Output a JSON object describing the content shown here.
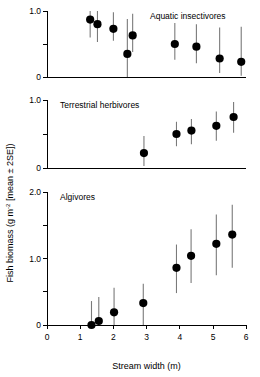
{
  "figure": {
    "ylabel_main": "Fish biomass (g m",
    "ylabel_sup": "-2",
    "ylabel_tail": " [mean ± 2SE])",
    "xlabel": "Stream width (m)",
    "marker_color": "#000000",
    "errorbar_color": "#7a7a7a",
    "axis_color": "#000000"
  },
  "chart_data": [
    {
      "type": "scatter",
      "title": "Aquatic insectivores",
      "panel": 1,
      "xlabel": "Stream width (m)",
      "ylabel": "Fish biomass (g m-2 [mean ± 2SE])",
      "xlim": [
        0,
        6
      ],
      "ylim": [
        0,
        1.0
      ],
      "xticks": [
        0,
        1,
        2,
        3,
        4,
        5,
        6
      ],
      "yticks": [
        0,
        0.5,
        1.0
      ],
      "ytick_labels": [
        "0",
        "",
        "1.0"
      ],
      "grid": false,
      "legend": "none",
      "errorbars": "mean ± 2SE",
      "points": [
        {
          "x": 1.3,
          "y": 0.87,
          "lo": 0.6,
          "hi": 1.0
        },
        {
          "x": 1.52,
          "y": 0.8,
          "lo": 0.53,
          "hi": 1.0
        },
        {
          "x": 2.0,
          "y": 0.73,
          "lo": 0.55,
          "hi": 0.98
        },
        {
          "x": 2.42,
          "y": 0.35,
          "lo": 0.0,
          "hi": 0.88
        },
        {
          "x": 2.58,
          "y": 0.63,
          "lo": 0.38,
          "hi": 0.96
        },
        {
          "x": 3.85,
          "y": 0.5,
          "lo": 0.26,
          "hi": 0.82
        },
        {
          "x": 4.5,
          "y": 0.46,
          "lo": 0.21,
          "hi": 0.8
        },
        {
          "x": 5.2,
          "y": 0.28,
          "lo": 0.06,
          "hi": 0.75
        },
        {
          "x": 5.85,
          "y": 0.23,
          "lo": 0.02,
          "hi": 0.76
        }
      ]
    },
    {
      "type": "scatter",
      "title": "Terrestrial herbivores",
      "panel": 2,
      "xlabel": "Stream width (m)",
      "ylabel": "Fish biomass (g m-2 [mean ± 2SE])",
      "xlim": [
        0,
        6
      ],
      "ylim": [
        0,
        1.0
      ],
      "xticks": [
        0,
        1,
        2,
        3,
        4,
        5,
        6
      ],
      "yticks": [
        0,
        0.5,
        1.0
      ],
      "ytick_labels": [
        "0",
        "",
        "1.0"
      ],
      "grid": false,
      "legend": "none",
      "errorbars": "mean ± 2SE",
      "points": [
        {
          "x": 2.92,
          "y": 0.22,
          "lo": 0.03,
          "hi": 0.47
        },
        {
          "x": 3.9,
          "y": 0.5,
          "lo": 0.32,
          "hi": 0.68
        },
        {
          "x": 4.35,
          "y": 0.55,
          "lo": 0.35,
          "hi": 0.72
        },
        {
          "x": 5.1,
          "y": 0.62,
          "lo": 0.4,
          "hi": 0.83
        },
        {
          "x": 5.62,
          "y": 0.75,
          "lo": 0.52,
          "hi": 0.97
        }
      ]
    },
    {
      "type": "scatter",
      "title": "Algivores",
      "panel": 3,
      "xlabel": "Stream width (m)",
      "ylabel": "Fish biomass (g m-2 [mean ± 2SE])",
      "xlim": [
        0,
        6
      ],
      "ylim": [
        0,
        2.0
      ],
      "xticks": [
        0,
        1,
        2,
        3,
        4,
        5,
        6
      ],
      "yticks": [
        0,
        0.5,
        1.0,
        1.5,
        2.0
      ],
      "ytick_labels": [
        "0",
        "",
        "1.0",
        "",
        "2.0"
      ],
      "grid": false,
      "legend": "none",
      "errorbars": "mean ± 2SE",
      "points": [
        {
          "x": 1.34,
          "y": 0.0,
          "lo": 0.0,
          "hi": 0.36
        },
        {
          "x": 1.56,
          "y": 0.06,
          "lo": 0.0,
          "hi": 0.42
        },
        {
          "x": 2.02,
          "y": 0.19,
          "lo": 0.0,
          "hi": 0.56
        },
        {
          "x": 2.9,
          "y": 0.33,
          "lo": 0.0,
          "hi": 0.62
        },
        {
          "x": 3.9,
          "y": 0.86,
          "lo": 0.48,
          "hi": 1.21
        },
        {
          "x": 4.34,
          "y": 1.04,
          "lo": 0.63,
          "hi": 1.44
        },
        {
          "x": 5.1,
          "y": 1.22,
          "lo": 0.75,
          "hi": 1.66
        },
        {
          "x": 5.58,
          "y": 1.36,
          "lo": 0.86,
          "hi": 1.81
        }
      ]
    }
  ]
}
